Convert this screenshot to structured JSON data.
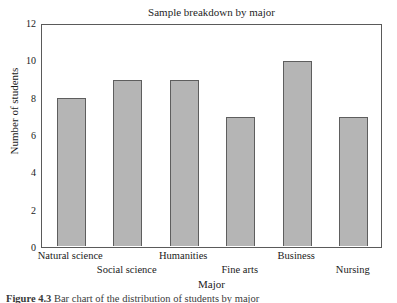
{
  "chart_data": {
    "type": "bar",
    "title": "Sample breakdown by major",
    "xlabel": "Major",
    "ylabel": "Number of students",
    "categories": [
      "Natural science",
      "Social science",
      "Humanities",
      "Fine arts",
      "Business",
      "Nursing"
    ],
    "values": [
      8,
      9,
      9,
      7,
      10,
      7
    ],
    "ylim": [
      0,
      12
    ],
    "ytick_labels": [
      "0",
      "2",
      "4",
      "6",
      "8",
      "10",
      "12"
    ],
    "ytick_values": [
      0,
      2,
      4,
      6,
      8,
      10,
      12
    ],
    "grid": false,
    "legend": "none",
    "bar_fill_color": "#b5b5b5",
    "bar_edge_color": "#5e5e5e",
    "frame_color": "#5a5a5a",
    "background_color": "#ffffff",
    "label_stagger_rows": [
      0,
      1,
      0,
      1,
      0,
      1
    ]
  },
  "caption": {
    "number": "Figure 4.3",
    "text": "Bar chart of the distribution of students by major"
  }
}
